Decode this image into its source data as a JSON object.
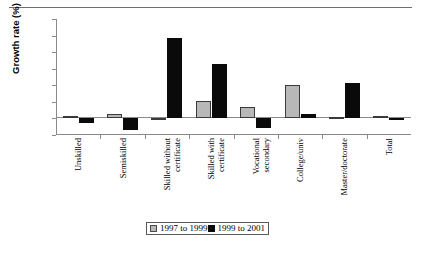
{
  "chart_data": {
    "type": "bar",
    "title": "",
    "xlabel": "",
    "ylabel": "Growth rate (%)",
    "ylim": [
      -20,
      120
    ],
    "yticks": [
      -20,
      0,
      20,
      40,
      60,
      80,
      100,
      120
    ],
    "ytick_labels": [
      "-20",
      "0",
      "20",
      "40",
      "60",
      "80",
      "100",
      "120"
    ],
    "grid": false,
    "legend_position": "bottom-center",
    "categories": [
      "Unskilled",
      "Semiskilled",
      "Skilled without certificate",
      "Skilled with certificate",
      "Vocational secondary",
      "College/univ",
      "Master/doctorate",
      "Total"
    ],
    "category_lines": [
      [
        "Unskilled"
      ],
      [
        "Semiskilled"
      ],
      [
        "Skilled without",
        "certificate"
      ],
      [
        "Skilled with",
        "certificate"
      ],
      [
        "Vocational",
        "secondary"
      ],
      [
        "College/univ"
      ],
      [
        "Master/doctorate"
      ],
      [
        "Total"
      ]
    ],
    "series": [
      {
        "name": "1997 to 1999",
        "color": "#b8b8b8",
        "values": [
          3,
          5,
          0,
          21,
          14,
          40,
          2,
          3
        ]
      },
      {
        "name": "1999 to 2001",
        "color": "#0a0a0a",
        "values": [
          -6,
          -14,
          97,
          66,
          -12,
          5,
          43,
          0
        ]
      }
    ]
  },
  "legend": {
    "items": [
      {
        "label": "1997 to 1999",
        "color": "#b8b8b8"
      },
      {
        "label": "1999 to 2001",
        "color": "#0a0a0a"
      }
    ]
  }
}
